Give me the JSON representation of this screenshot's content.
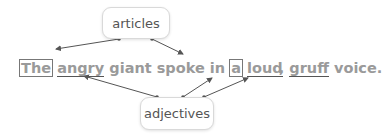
{
  "labels": {
    "articles": "articles",
    "adjectives": "adjectives"
  },
  "sentence": {
    "words": [
      {
        "text": "The",
        "role": "article"
      },
      {
        "text": "angry",
        "role": "adjective"
      },
      {
        "text": "giant",
        "role": ""
      },
      {
        "text": "spoke",
        "role": ""
      },
      {
        "text": "in",
        "role": ""
      },
      {
        "text": "a",
        "role": "article"
      },
      {
        "text": "loud",
        "role": "adjective"
      },
      {
        "text": ",",
        "role": ""
      },
      {
        "text": "gruff",
        "role": "adjective"
      },
      {
        "text": "voice.",
        "role": ""
      }
    ]
  },
  "colors": {
    "text": "#9a9a9a",
    "arrow": "#555555",
    "box_border": "#d9d9d9"
  }
}
